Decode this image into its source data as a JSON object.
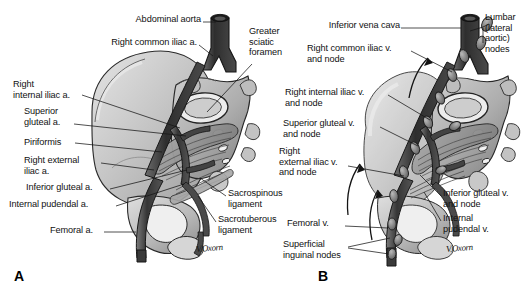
{
  "figure": {
    "type": "medical-illustration",
    "style": "grayscale line-and-wash anatomical drawing",
    "background_color": "#ffffff",
    "ink_color": "#111111",
    "artist_signature": "V.Oxorn"
  },
  "panels": [
    {
      "letter": "A",
      "name": "arterial-panel"
    },
    {
      "letter": "B",
      "name": "venous-lymphatic-panel"
    }
  ],
  "panel_a": {
    "letter": "A",
    "signature": "V.Oxorn",
    "labels": [
      {
        "id": "abdominal-aorta",
        "text": "Abdominal aorta",
        "align": "right",
        "x": 200,
        "y": 18
      },
      {
        "id": "right-common-iliac-artery",
        "text": "Right common iliac a.",
        "align": "right",
        "x": 196,
        "y": 41
      },
      {
        "id": "greater-sciatic-foramen",
        "text": "Greater\nsciatic\nforamen",
        "align": "left",
        "x": 249,
        "y": 30
      },
      {
        "id": "right-internal-iliac-artery",
        "text": "Right\ninternal iliac a.",
        "align": "left",
        "x": 13,
        "y": 83
      },
      {
        "id": "superior-gluteal-artery",
        "text": "Superior\ngluteal a.",
        "align": "left",
        "x": 24,
        "y": 110
      },
      {
        "id": "piriformis",
        "text": "Piriformis",
        "align": "left",
        "x": 24,
        "y": 142
      },
      {
        "id": "right-external-iliac-artery",
        "text": "Right external\niliac a.",
        "align": "left",
        "x": 24,
        "y": 160
      },
      {
        "id": "inferior-gluteal-artery",
        "text": "Inferior gluteal a.",
        "align": "left",
        "x": 26,
        "y": 186
      },
      {
        "id": "internal-pudendal-artery",
        "text": "Internal pudendal a.",
        "align": "left",
        "x": 10,
        "y": 204
      },
      {
        "id": "femoral-artery",
        "text": "Femoral a.",
        "align": "left",
        "x": 59,
        "y": 229
      },
      {
        "id": "sacrospinous-ligament",
        "text": "Sacrospinous\nligament",
        "align": "left",
        "x": 228,
        "y": 192
      },
      {
        "id": "sacrotuberous-ligament",
        "text": "Sacrotuberous\nligament",
        "align": "left",
        "x": 218,
        "y": 218
      }
    ]
  },
  "panel_b": {
    "letter": "B",
    "signature": "V.Oxorn",
    "labels": [
      {
        "id": "inferior-vena-cava",
        "text": "Inferior vena cava",
        "align": "right",
        "x": 330,
        "y": 24
      },
      {
        "id": "lumbar-lateral-aortic-nodes",
        "text": "Lumbar\n(lateral\naortic)\nnodes",
        "align": "left",
        "x": 485,
        "y": 16
      },
      {
        "id": "right-common-iliac-vein-and-node",
        "text": "Right common iliac v.\nand node",
        "align": "left",
        "x": 311,
        "y": 47
      },
      {
        "id": "right-internal-iliac-vein-and-node",
        "text": "Right internal iliac v.\nand node",
        "align": "left",
        "x": 288,
        "y": 91
      },
      {
        "id": "superior-gluteal-vein-and-node",
        "text": "Superior gluteal v.\nand node",
        "align": "left",
        "x": 285,
        "y": 122
      },
      {
        "id": "right-external-iliac-vein-and-node",
        "text": "Right\nexternal iliac v.\nand node",
        "align": "left",
        "x": 280,
        "y": 152
      },
      {
        "id": "inferior-gluteal-vein-and-node",
        "text": "Inferior gluteal v.\nand node",
        "align": "left",
        "x": 443,
        "y": 192
      },
      {
        "id": "internal-pudendal-vein",
        "text": "Internal\npudendal v.",
        "align": "left",
        "x": 443,
        "y": 217
      },
      {
        "id": "femoral-vein",
        "text": "Femoral v.",
        "align": "left",
        "x": 303,
        "y": 222
      },
      {
        "id": "superficial-inguinal-nodes",
        "text": "Superficial\ninguinal nodes",
        "align": "left",
        "x": 287,
        "y": 243
      }
    ]
  },
  "colors": {
    "vessel_dark": "#3b3b3b",
    "vessel_mid": "#585858",
    "bone_light": "#d2d2d2",
    "bone_mid": "#b4b4b4",
    "muscle": "#9a9a9a",
    "outline": "#1f1f1f",
    "node_fill": "#6f6f6f",
    "text": "#111111",
    "background": "#ffffff"
  }
}
